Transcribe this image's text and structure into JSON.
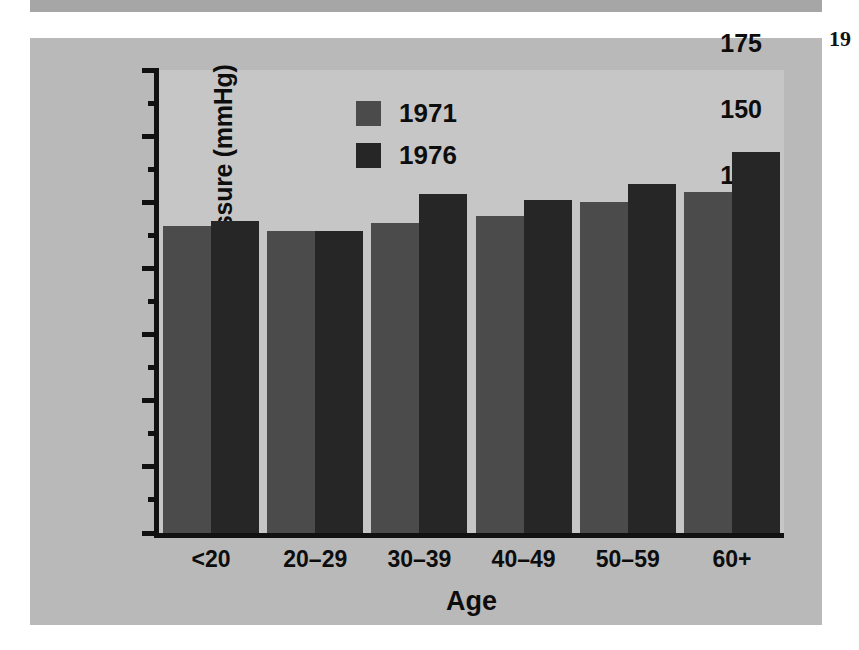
{
  "page": {
    "page_number": "19",
    "panel_color": "#b9b9b9",
    "plot_background": "#c6c6c6",
    "strip_color": "#a6a6a6"
  },
  "chart_data": {
    "type": "bar",
    "title": "",
    "subtitle": "",
    "xlabel": "Age",
    "ylabel": "Systolic Blood Pressure (mmHg)",
    "categories": [
      "<20",
      "20–29",
      "30–39",
      "40–49",
      "50–59",
      "60+"
    ],
    "series": [
      {
        "name": "1971",
        "color": "#4b4b4b",
        "values": [
          116,
          114,
          117,
          120,
          125,
          129
        ]
      },
      {
        "name": "1976",
        "color": "#262626",
        "values": [
          118,
          114,
          128,
          126,
          132,
          144
        ]
      }
    ],
    "ylim": [
      0,
      175
    ],
    "ytick_values": [
      0,
      25,
      50,
      75,
      100,
      125,
      150,
      175
    ],
    "ytick_labels": [
      "0",
      "25",
      "50",
      "75",
      "100",
      "125",
      "150",
      "175"
    ],
    "yminor_tick_values": [
      12.5,
      37.5,
      62.5,
      87.5,
      112.5,
      137.5,
      162.5
    ],
    "grid": false,
    "legend_position": "top-left-inside",
    "legend_entries": [
      "1971",
      "1976"
    ],
    "annotations": []
  }
}
